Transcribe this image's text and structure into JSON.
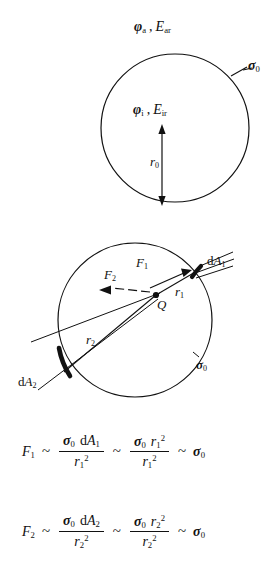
{
  "figure": {
    "caption": "",
    "diagrams": [
      {
        "id": "uncharged-sphere",
        "circle": {
          "cx": 175,
          "cy": 128,
          "r": 74
        },
        "labels": {
          "outside_potential": "φa , Ear",
          "outside_potential_symbol": "φ",
          "outside_potential_sub": "a",
          "outside_field_symbol": "E",
          "outside_field_sub": "ar",
          "surface_charge": "σ",
          "surface_charge_sub": "0",
          "inside_potential_symbol": "φ",
          "inside_potential_sub": "i",
          "inside_field_symbol": "E",
          "inside_field_sub": "ir",
          "radius_symbol": "r",
          "radius_sub": "0",
          "separator": ","
        }
      },
      {
        "id": "charge-inside-sphere",
        "circle": {
          "cx": 135,
          "cy": 320,
          "r": 77
        },
        "point_charge": "Q",
        "labels": {
          "force_1_symbol": "F",
          "force_1_sub": "1",
          "force_2_symbol": "F",
          "force_2_sub": "2",
          "area_1": "d",
          "area_1_symbol": "A",
          "area_1_sub": "1",
          "area_2": "d",
          "area_2_symbol": "A",
          "area_2_sub": "2",
          "radius_1_symbol": "r",
          "radius_1_sub": "1",
          "radius_2_symbol": "r",
          "radius_2_sub": "2",
          "surface_charge": "σ",
          "surface_charge_sub": "0"
        }
      }
    ],
    "equations": [
      {
        "id": "force-1",
        "lhs_symbol": "F",
        "lhs_sub": "1",
        "rel": "~",
        "frac1_num_sigma": "σ",
        "frac1_num_sigma_sub": "0",
        "frac1_num_d": "d",
        "frac1_num_A": "A",
        "frac1_num_A_sub": "1",
        "frac1_den_r": "r",
        "frac1_den_sub": "1",
        "frac1_den_sup": "2",
        "frac2_num_sigma": "σ",
        "frac2_num_sigma_sub": "0",
        "frac2_num_r": "r",
        "frac2_num_r_sub": "1",
        "frac2_num_r_sup": "2",
        "frac2_den_r": "r",
        "frac2_den_sub": "1",
        "frac2_den_sup": "2",
        "rhs_sigma": "σ",
        "rhs_sigma_sub": "0"
      },
      {
        "id": "force-2",
        "lhs_symbol": "F",
        "lhs_sub": "2",
        "rel": "~",
        "frac1_num_sigma": "σ",
        "frac1_num_sigma_sub": "0",
        "frac1_num_d": "d",
        "frac1_num_A": "A",
        "frac1_num_A_sub": "2",
        "frac1_den_r": "r",
        "frac1_den_sub": "2",
        "frac1_den_sup": "2",
        "frac2_num_sigma": "σ",
        "frac2_num_sigma_sub": "0",
        "frac2_num_r": "r",
        "frac2_num_r_sub": "2",
        "frac2_num_r_sup": "2",
        "frac2_den_r": "r",
        "frac2_den_sub": "2",
        "frac2_den_sup": "2",
        "rhs_sigma": "σ",
        "rhs_sigma_sub": "0"
      }
    ],
    "style": {
      "ink": "#111111",
      "paper": "#ffffff"
    }
  }
}
